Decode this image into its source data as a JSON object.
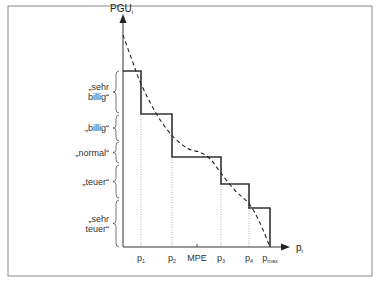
{
  "chart_data": {
    "type": "line",
    "title": "",
    "ylabel": "PGU",
    "ylabel_sub": "i",
    "xlabel": "p",
    "xlabel_sub": "i",
    "x_ticks": [
      {
        "label": "p",
        "sub": "1",
        "x": 1
      },
      {
        "label": "p",
        "sub": "2",
        "x": 2
      },
      {
        "label": "MPE",
        "sub": "",
        "x": 2.8
      },
      {
        "label": "p",
        "sub": "3",
        "x": 4
      },
      {
        "label": "p",
        "sub": "4",
        "x": 5
      },
      {
        "label": "p",
        "sub": "max",
        "x": 5.8
      }
    ],
    "categories": [
      "„sehr billig“",
      "„billig“",
      "„normal“",
      "„teuer“",
      "„sehr teuer“"
    ],
    "category_lines": [
      [
        "„sehr",
        "billig“"
      ],
      [
        "„billig“"
      ],
      [
        "„normal“"
      ],
      [
        "„teuer“"
      ],
      [
        "„sehr",
        "teuer“"
      ]
    ],
    "series": [
      {
        "name": "Preis-Nutzen-Stufenfunktion",
        "style": "solid",
        "points": [
          [
            0,
            5
          ],
          [
            1,
            5
          ],
          [
            1,
            4
          ],
          [
            2,
            4
          ],
          [
            2,
            3
          ],
          [
            4,
            3
          ],
          [
            4,
            2.5
          ],
          [
            5,
            2.5
          ],
          [
            5,
            1.4
          ],
          [
            5.8,
            1.4
          ],
          [
            5.8,
            0
          ]
        ]
      },
      {
        "name": "Stetige Preis-Nutzen-Funktion",
        "style": "dashed",
        "points": [
          [
            0,
            6.3
          ],
          [
            0.5,
            5.4
          ],
          [
            1,
            4.7
          ],
          [
            1.5,
            4.0
          ],
          [
            2,
            3.5
          ],
          [
            2.5,
            3.2
          ],
          [
            3,
            3.1
          ],
          [
            3.5,
            2.95
          ],
          [
            4,
            2.7
          ],
          [
            4.5,
            2.2
          ],
          [
            5,
            1.6
          ],
          [
            5.4,
            0.9
          ],
          [
            5.8,
            0
          ]
        ]
      }
    ],
    "xlim": [
      0,
      6.5
    ],
    "ylim": [
      0,
      7.2
    ],
    "grid": false,
    "legend": "none"
  }
}
